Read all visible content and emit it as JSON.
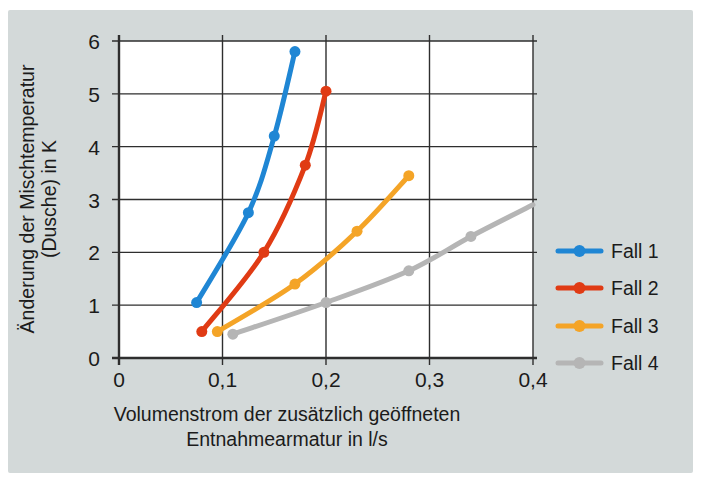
{
  "figure": {
    "panel_color": "#d3d9d9",
    "plot_background": "#ffffff",
    "grid_color": "#2e2e2e",
    "text_color": "#1b1b1b"
  },
  "chart_data": {
    "type": "line",
    "title": "",
    "xlabel_lines": [
      "Volumenstrom der zusätzlich geöffneten",
      "Entnahmearmatur in l/s"
    ],
    "ylabel_lines": [
      "Änderung der Mischtemperatur",
      "(Dusche) in K"
    ],
    "xlim": [
      0,
      0.4
    ],
    "ylim": [
      0,
      6
    ],
    "grid": true,
    "legend_position": "right",
    "x_ticks": [
      {
        "value": 0,
        "label": "0"
      },
      {
        "value": 0.1,
        "label": "0,1"
      },
      {
        "value": 0.2,
        "label": "0,2"
      },
      {
        "value": 0.3,
        "label": "0,3"
      },
      {
        "value": 0.4,
        "label": "0,4"
      }
    ],
    "y_ticks": [
      {
        "value": 0,
        "label": "0"
      },
      {
        "value": 1,
        "label": "1"
      },
      {
        "value": 2,
        "label": "2"
      },
      {
        "value": 3,
        "label": "3"
      },
      {
        "value": 4,
        "label": "4"
      },
      {
        "value": 5,
        "label": "5"
      },
      {
        "value": 6,
        "label": "6"
      }
    ],
    "series": [
      {
        "name": "Fall 1",
        "color": "#1f86d4",
        "points": [
          [
            0.075,
            1.05
          ],
          [
            0.125,
            2.75
          ],
          [
            0.15,
            4.2
          ],
          [
            0.17,
            5.8
          ]
        ]
      },
      {
        "name": "Fall 2",
        "color": "#e03b14",
        "points": [
          [
            0.08,
            0.5
          ],
          [
            0.14,
            2.0
          ],
          [
            0.18,
            3.65
          ],
          [
            0.2,
            5.05
          ]
        ]
      },
      {
        "name": "Fall 3",
        "color": "#f4a427",
        "points": [
          [
            0.095,
            0.5
          ],
          [
            0.17,
            1.4
          ],
          [
            0.23,
            2.4
          ],
          [
            0.28,
            3.45
          ]
        ]
      },
      {
        "name": "Fall 4",
        "color": "#b5b5b5",
        "points": [
          [
            0.11,
            0.45
          ],
          [
            0.2,
            1.05
          ],
          [
            0.28,
            1.65
          ],
          [
            0.34,
            2.3
          ]
        ],
        "line_extension": [
          [
            0.4,
            2.9
          ]
        ]
      }
    ]
  }
}
